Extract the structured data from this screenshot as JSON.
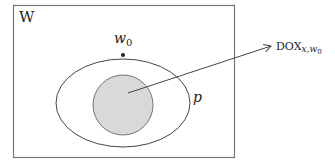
{
  "diagram": {
    "frame_label": "W",
    "point_label": "w",
    "point_subscript": "0",
    "set_label": "p",
    "arrow_target_label": "DOX",
    "arrow_target_subscript": "x,w",
    "arrow_target_subsubscript": "0",
    "colors": {
      "stroke": "#444444",
      "inner_fill": "#d9d9d9",
      "background": "#ffffff"
    }
  }
}
